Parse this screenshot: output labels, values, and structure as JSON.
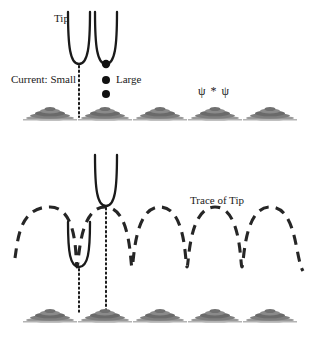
{
  "figure": {
    "title_visible": false,
    "width": 319,
    "height": 337,
    "background_color": "#ffffff",
    "ink_color": "#1a1a1a",
    "atom_color": "#6e6e6e",
    "atom_shadow_color": "#8c8c8c"
  },
  "labels": {
    "tip": "Tip",
    "current_small": "Current: Small",
    "current_large": "Large",
    "psi_star_psi": "ψ * ψ",
    "trace_of_tip": "Trace of Tip"
  },
  "panels": {
    "top": {
      "name": "constant-height-panel",
      "description": "STM tip at two lateral positions above a row of surface atoms; tunneling current small over gap, large over atom.",
      "tips": [
        {
          "id": "tip-left",
          "apex_x": 79,
          "apex_y": 64,
          "top_y": 12,
          "half_width": 11,
          "has_apex_dot": false
        },
        {
          "id": "tip-right",
          "apex_x": 106,
          "apex_y": 64,
          "top_y": 12,
          "half_width": 11,
          "has_apex_dot": true
        }
      ],
      "electron_dots": [
        {
          "cx": 106,
          "cy": 64,
          "r": 4.0
        },
        {
          "cx": 106,
          "cy": 80,
          "r": 4.0
        },
        {
          "cx": 106,
          "cy": 94,
          "r": 4.0
        }
      ],
      "dotted_guides": [
        {
          "x": 79,
          "y1": 66,
          "y2": 116
        }
      ],
      "atom_row_baseline_y": 118,
      "atom_centers_x": [
        50,
        105,
        160,
        215,
        270
      ]
    },
    "bottom": {
      "name": "constant-current-panel",
      "description": "Tip follows a dashed sinusoidal trace over the atom row; tip drawn at a trace peak and at a trace valley.",
      "tips": [
        {
          "id": "tip-peak",
          "apex_x": 106,
          "apex_y": 205,
          "top_y": 155,
          "half_width": 11
        },
        {
          "id": "tip-valley",
          "apex_x": 79,
          "apex_y": 266,
          "top_y": 222,
          "half_width": 11
        }
      ],
      "dotted_guides": [
        {
          "x": 79,
          "y1": 268,
          "y2": 312
        },
        {
          "x": 106,
          "y1": 207,
          "y2": 312
        }
      ],
      "trace": {
        "style": "dashed",
        "peak_y": 207,
        "valley_y": 267,
        "peaks_x": [
          50,
          105,
          160,
          215,
          270
        ],
        "valleys_x": [
          22,
          77,
          132,
          187,
          242,
          297
        ],
        "x_start": 15,
        "x_end": 305
      },
      "atom_row_baseline_y": 320,
      "atom_centers_x": [
        50,
        105,
        160,
        215,
        270
      ]
    }
  },
  "atom_shape": {
    "half_width": 24,
    "height": 13,
    "layers": 4
  }
}
